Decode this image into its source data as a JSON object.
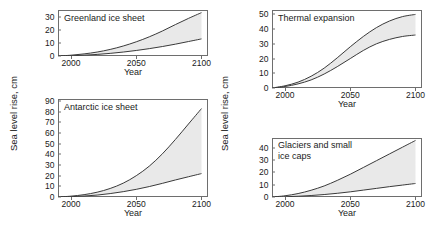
{
  "figure": {
    "background_color": "#ffffff",
    "band_color": "#e9e9e9",
    "curve_color": "#3a3a3a",
    "frame_color": "#6e6e6e"
  },
  "axis_labels": {
    "y_left": "Sea level rise, cm",
    "y_right": "Sea level rise, cm",
    "x": "Year"
  },
  "chart_data": [
    {
      "type": "area",
      "title": "Greenland ice sheet",
      "panel": "top-left",
      "xlabel": "Year",
      "ylabel": "Sea level rise, cm",
      "xlim": [
        1990,
        2105
      ],
      "ylim": [
        0,
        35
      ],
      "xticks": [
        2000,
        2050,
        2100
      ],
      "yticks": [
        0,
        10,
        20,
        30
      ],
      "grid": false,
      "legend": "none",
      "x": [
        1990,
        2000,
        2010,
        2020,
        2030,
        2040,
        2050,
        2060,
        2070,
        2080,
        2090,
        2100
      ],
      "series": [
        {
          "name": "upper bound",
          "values": [
            0,
            0.6,
            1.6,
            3.0,
            5.0,
            7.6,
            10.8,
            14.6,
            19.0,
            23.9,
            28.6,
            33.0
          ]
        },
        {
          "name": "lower bound",
          "values": [
            0,
            0.2,
            0.6,
            1.2,
            2.0,
            3.0,
            4.2,
            5.6,
            7.2,
            9.0,
            11.0,
            13.0
          ]
        }
      ]
    },
    {
      "type": "area",
      "title": "Thermal expansion",
      "panel": "top-right",
      "xlabel": "Year",
      "ylabel": "Sea level rise, cm",
      "xlim": [
        1990,
        2105
      ],
      "ylim": [
        0,
        53
      ],
      "xticks": [
        2000,
        2050,
        2100
      ],
      "yticks": [
        0,
        10,
        20,
        30,
        40,
        50
      ],
      "grid": false,
      "legend": "none",
      "x": [
        1990,
        2000,
        2010,
        2020,
        2030,
        2040,
        2050,
        2060,
        2070,
        2080,
        2090,
        2100
      ],
      "series": [
        {
          "name": "upper bound",
          "values": [
            0,
            1.5,
            4.0,
            8.0,
            13.5,
            20.5,
            28.0,
            35.0,
            41.0,
            45.5,
            48.5,
            50.0
          ]
        },
        {
          "name": "lower bound",
          "values": [
            0,
            1.0,
            2.8,
            5.5,
            9.5,
            14.5,
            20.0,
            25.5,
            30.0,
            33.0,
            35.0,
            36.0
          ]
        }
      ]
    },
    {
      "type": "area",
      "title": "Antarctic ice sheet",
      "panel": "bottom-left",
      "xlabel": "Year",
      "ylabel": "Sea level rise, cm",
      "xlim": [
        1990,
        2105
      ],
      "ylim": [
        0,
        92
      ],
      "xticks": [
        2000,
        2050,
        2100
      ],
      "yticks": [
        0,
        10,
        20,
        30,
        40,
        50,
        60,
        70,
        80,
        90
      ],
      "grid": false,
      "legend": "none",
      "x": [
        1990,
        2000,
        2010,
        2020,
        2030,
        2040,
        2050,
        2060,
        2070,
        2080,
        2090,
        2100
      ],
      "series": [
        {
          "name": "upper bound",
          "values": [
            0,
            0.8,
            2.2,
            4.5,
            8.0,
            13.0,
            20.0,
            29.0,
            40.5,
            54.0,
            68.5,
            83.0
          ]
        },
        {
          "name": "lower bound",
          "values": [
            0,
            0.3,
            0.9,
            1.8,
            3.2,
            5.0,
            7.2,
            9.8,
            12.8,
            16.0,
            19.0,
            22.0
          ]
        }
      ]
    },
    {
      "type": "area",
      "title": "Glaciers and small\nice caps",
      "panel": "bottom-right",
      "xlabel": "Year",
      "ylabel": "Sea level rise, cm",
      "xlim": [
        1990,
        2105
      ],
      "ylim": [
        0,
        48
      ],
      "xticks": [
        2000,
        2050,
        2100
      ],
      "yticks": [
        0,
        10,
        20,
        30,
        40
      ],
      "grid": false,
      "legend": "none",
      "x": [
        1990,
        2000,
        2010,
        2020,
        2030,
        2040,
        2050,
        2060,
        2070,
        2080,
        2090,
        2100
      ],
      "series": [
        {
          "name": "upper bound",
          "values": [
            0,
            1.0,
            2.8,
            5.5,
            9.0,
            13.5,
            18.5,
            24.0,
            29.5,
            35.0,
            40.5,
            46.0
          ]
        },
        {
          "name": "lower bound",
          "values": [
            0,
            0.2,
            0.6,
            1.2,
            2.0,
            3.0,
            4.2,
            5.6,
            7.0,
            8.4,
            9.7,
            11.0
          ]
        }
      ]
    }
  ]
}
